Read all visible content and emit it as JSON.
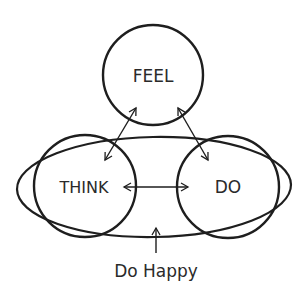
{
  "diagram": {
    "nodes": [
      {
        "id": "feel",
        "label": "FEEL"
      },
      {
        "id": "think",
        "label": "THINK"
      },
      {
        "id": "do",
        "label": "DO"
      }
    ],
    "edges": [
      {
        "from": "think",
        "to": "feel",
        "bidirectional": true
      },
      {
        "from": "do",
        "to": "feel",
        "bidirectional": true
      },
      {
        "from": "think",
        "to": "do",
        "bidirectional": true
      }
    ],
    "enclosure": {
      "label": "Do Happy",
      "encloses": [
        "think",
        "do"
      ]
    },
    "colors": {
      "stroke": "#1e1e1e",
      "background": "#ffffff"
    }
  }
}
